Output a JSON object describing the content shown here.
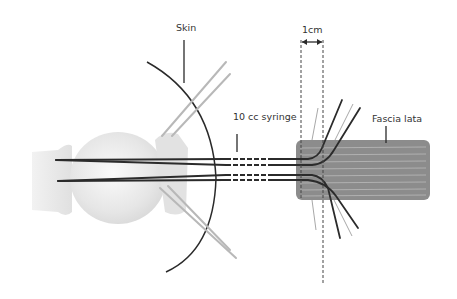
{
  "labels": {
    "skin": "Skin",
    "dimension": "1cm",
    "syringe": "10 cc syringe",
    "fascia": "Fascia lata"
  },
  "colors": {
    "background": "#ffffff",
    "syringe_body": "#e8e8e8",
    "syringe_tip": "#eeeeee",
    "fascia_fill": "#8c8c8c",
    "fascia_stripe": "#b0b0b0",
    "suture_dark": "#2b2b2b",
    "suture_light": "#a8a8a8",
    "skin_line": "#2a2a2a",
    "label_text": "#333333"
  }
}
